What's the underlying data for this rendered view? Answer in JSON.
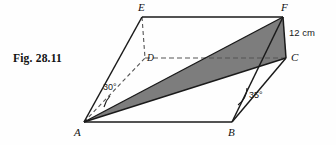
{
  "figure": {
    "caption": "Fig. 28.11",
    "background_color": "#fefefe",
    "stroke_color": "#1a1a1a",
    "shade_color": "#7d7d7d",
    "dash_color": "#555555"
  },
  "vertices": [
    {
      "name": "A",
      "label": "A",
      "x": 84,
      "y": 122,
      "label_x": 74,
      "label_y": 126
    },
    {
      "name": "B",
      "label": "B",
      "x": 232,
      "y": 122,
      "label_x": 228,
      "label_y": 126
    },
    {
      "name": "C",
      "label": "C",
      "x": 286,
      "y": 58,
      "label_x": 291,
      "label_y": 52
    },
    {
      "name": "D",
      "label": "D",
      "x": 145,
      "y": 58,
      "label_x": 147,
      "label_y": 53
    },
    {
      "name": "E",
      "label": "E",
      "x": 142,
      "y": 17,
      "label_x": 138,
      "label_y": 1
    },
    {
      "name": "F",
      "label": "F",
      "x": 283,
      "y": 17,
      "label_x": 281,
      "label_y": 1
    }
  ],
  "measurements": [
    {
      "name": "edge-FC-length",
      "text": "12 cm",
      "x": 289,
      "y": 27
    }
  ],
  "angles": [
    {
      "name": "angle-at-A",
      "text": "30°",
      "x": 103,
      "y": 82,
      "value": 30,
      "at_vertex": "A",
      "between": [
        "AD",
        "AC"
      ]
    },
    {
      "name": "angle-at-B",
      "text": "35°",
      "x": 249,
      "y": 90,
      "value": 35,
      "at_vertex": "B",
      "between": [
        "BA",
        "BF"
      ]
    }
  ],
  "shaded_region": {
    "name": "triangle-AFC",
    "vertices": [
      "A",
      "F",
      "C"
    ],
    "fill": "#7d7d7d"
  },
  "solid_edges": [
    {
      "name": "edge-EF",
      "from": "E",
      "to": "F"
    },
    {
      "name": "edge-EA",
      "from": "E",
      "to": "A"
    },
    {
      "name": "edge-FC",
      "from": "F",
      "to": "C"
    },
    {
      "name": "edge-FB",
      "from": "F",
      "to": "B"
    },
    {
      "name": "edge-AB",
      "from": "A",
      "to": "B"
    },
    {
      "name": "edge-BC",
      "from": "B",
      "to": "C"
    },
    {
      "name": "edge-AF",
      "from": "A",
      "to": "F"
    },
    {
      "name": "edge-AC",
      "from": "A",
      "to": "C"
    }
  ],
  "dashed_edges": [
    {
      "name": "edge-ED",
      "from": "E",
      "to": "D"
    },
    {
      "name": "edge-DC",
      "from": "D",
      "to": "C"
    },
    {
      "name": "edge-AD",
      "from": "A",
      "to": "D"
    }
  ]
}
